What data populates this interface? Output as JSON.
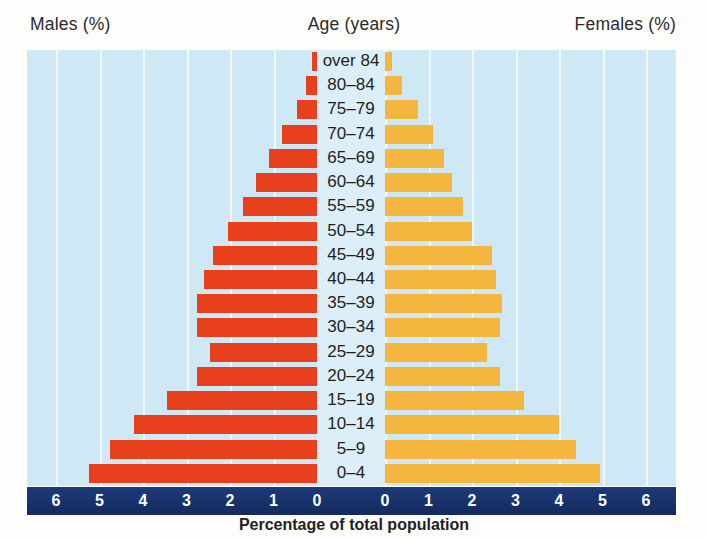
{
  "header": {
    "males_label": "Males (%)",
    "age_label": "Age (years)",
    "females_label": "Females (%)"
  },
  "caption": "Percentage of total population",
  "colors": {
    "male_bar": "#e8401c",
    "female_bar": "#f5b63f",
    "plot_background": "#cfe8f5",
    "axis_strip": "#17316b",
    "gridline": "#f2fafd",
    "label_panel": "#dceef8",
    "text": "#231f20"
  },
  "axis": {
    "left_ticks": [
      "6",
      "5",
      "4",
      "3",
      "2",
      "1",
      "0"
    ],
    "right_ticks": [
      "0",
      "1",
      "2",
      "3",
      "4",
      "5",
      "6"
    ],
    "min": 0,
    "max": 6,
    "step": 1
  },
  "chart_data": {
    "type": "bar",
    "title": "",
    "subtitle": "",
    "xlabel": "Percentage of total population",
    "ylabel": "Age (years)",
    "orientation": "horizontal",
    "layout": "population-pyramid",
    "grid": true,
    "legend_position": "top",
    "xlim": [
      0,
      6
    ],
    "xticks": [
      0,
      1,
      2,
      3,
      4,
      5,
      6
    ],
    "categories": [
      "over 84",
      "80-84",
      "75-79",
      "70-74",
      "65-69",
      "60-64",
      "55-59",
      "50-54",
      "45-49",
      "40-44",
      "35-39",
      "30-34",
      "25-29",
      "20-24",
      "15-19",
      "10-14",
      "5-9",
      "0-4"
    ],
    "category_labels": [
      "over 84",
      "80–84",
      "75–79",
      "70–74",
      "65–69",
      "60–64",
      "55–59",
      "50–54",
      "45–49",
      "40–44",
      "35–39",
      "30–34",
      "25–29",
      "20–24",
      "15–19",
      "10–14",
      "5–9",
      "0–4"
    ],
    "series": [
      {
        "name": "Males (%)",
        "side": "left",
        "color": "#e8401c",
        "values": [
          0.12,
          0.26,
          0.45,
          0.8,
          1.1,
          1.4,
          1.7,
          2.05,
          2.4,
          2.6,
          2.75,
          2.75,
          2.45,
          2.75,
          3.45,
          4.2,
          4.75,
          5.25
        ]
      },
      {
        "name": "Females (%)",
        "side": "right",
        "color": "#f5b63f",
        "values": [
          0.15,
          0.4,
          0.75,
          1.1,
          1.35,
          1.55,
          1.8,
          2.0,
          2.45,
          2.55,
          2.7,
          2.65,
          2.35,
          2.65,
          3.2,
          4.0,
          4.4,
          4.95
        ]
      }
    ]
  }
}
